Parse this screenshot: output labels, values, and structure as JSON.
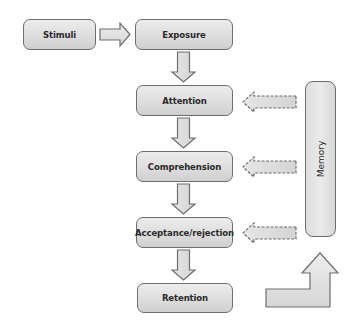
{
  "diagram": {
    "title": "",
    "nodes": {
      "stimuli": "Stimuli",
      "exposure": "Exposure",
      "attention": "Attention",
      "comprehension": "Comprehension",
      "acceptance": "Acceptance/rejection",
      "retention": "Retention",
      "memory": "Memory"
    },
    "edges": [
      {
        "from": "Stimuli",
        "to": "Exposure",
        "style": "solid"
      },
      {
        "from": "Exposure",
        "to": "Attention",
        "style": "solid"
      },
      {
        "from": "Attention",
        "to": "Comprehension",
        "style": "solid"
      },
      {
        "from": "Comprehension",
        "to": "Acceptance/rejection",
        "style": "solid"
      },
      {
        "from": "Acceptance/rejection",
        "to": "Retention",
        "style": "solid"
      },
      {
        "from": "Memory",
        "to": "Attention",
        "style": "dashed"
      },
      {
        "from": "Memory",
        "to": "Comprehension",
        "style": "dashed"
      },
      {
        "from": "Memory",
        "to": "Acceptance/rejection",
        "style": "dashed"
      },
      {
        "from": "Retention",
        "to": "Memory",
        "style": "solid"
      }
    ],
    "colors": {
      "box_fill": "#dcdcdc",
      "box_border": "#6e6e6e",
      "arrow_fill": "#e0e0e0",
      "text": "#2a2a2a"
    }
  }
}
